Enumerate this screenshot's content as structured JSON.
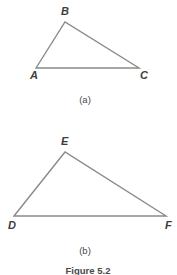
{
  "figure": {
    "caption": "Figure 5.2",
    "background_color": "#ffffff",
    "line_color": "#8a8a8a",
    "label_color": "#3d3d3d",
    "parts": [
      {
        "id": "a",
        "caption": "(a)",
        "shape": "triangle",
        "vertices": [
          {
            "label": "A",
            "x": 36,
            "y": 68,
            "label_x": 30,
            "label_y": 79
          },
          {
            "label": "B",
            "x": 65,
            "y": 22,
            "label_x": 61,
            "label_y": 15
          },
          {
            "label": "C",
            "x": 139,
            "y": 68,
            "label_x": 140,
            "label_y": 79
          }
        ]
      },
      {
        "id": "b",
        "caption": "(b)",
        "shape": "triangle",
        "vertices": [
          {
            "label": "D",
            "x": 14,
            "y": 216,
            "label_x": 8,
            "label_y": 229
          },
          {
            "label": "E",
            "x": 65,
            "y": 152,
            "label_x": 61,
            "label_y": 145
          },
          {
            "label": "F",
            "x": 166,
            "y": 216,
            "label_x": 165,
            "label_y": 229
          }
        ]
      }
    ]
  }
}
